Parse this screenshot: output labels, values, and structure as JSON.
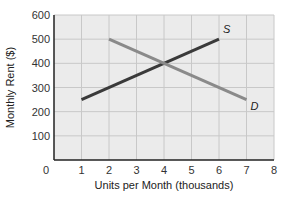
{
  "chart_data": {
    "type": "line",
    "title": "",
    "xlabel": "Units per Month (thousands)",
    "ylabel": "Monthly Rent ($)",
    "xlim": [
      0,
      8
    ],
    "ylim": [
      0,
      600
    ],
    "x_ticks": [
      "0",
      "1",
      "2",
      "3",
      "4",
      "5",
      "6",
      "7",
      "8"
    ],
    "y_ticks": [
      "100",
      "200",
      "300",
      "400",
      "500",
      "600"
    ],
    "grid": true,
    "legend": "none (curves labeled inline)",
    "series": [
      {
        "name": "S",
        "label": "S",
        "color": "#3a3a3a",
        "points": [
          [
            1,
            250
          ],
          [
            6,
            500
          ]
        ]
      },
      {
        "name": "D",
        "label": "D",
        "color": "#8a8a8a",
        "points": [
          [
            2,
            500
          ],
          [
            7,
            250
          ]
        ]
      }
    ],
    "annotations": [
      "S",
      "D"
    ],
    "equilibrium": {
      "x": 4,
      "y": 400
    }
  },
  "colors": {
    "plot_background": "#ebebeb",
    "grid": "#c8c8c8",
    "axis": "#222222",
    "supply": "#3a3a3a",
    "demand": "#8a8a8a"
  }
}
